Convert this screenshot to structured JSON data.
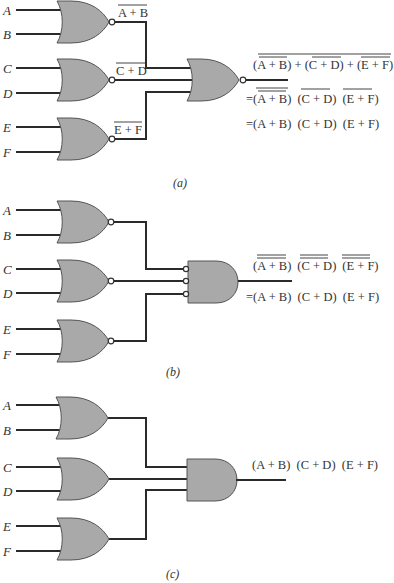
{
  "figure": {
    "panels": [
      {
        "caption": "(a)",
        "inputs": [
          "A",
          "B",
          "C",
          "D",
          "E",
          "F"
        ],
        "first_stage_gate": "NOR",
        "intermediate_labels": [
          "A + B",
          "C + D",
          "E + F"
        ],
        "second_stage_gate": "NOR",
        "output_expressions": [
          "(A + B) + (C + D) + (E + F)",
          "=(A + B) (C + D) (E + F)",
          "=(A + B) (C + D) (E + F)"
        ]
      },
      {
        "caption": "(b)",
        "inputs": [
          "A",
          "B",
          "C",
          "D",
          "E",
          "F"
        ],
        "first_stage_gate": "NOR",
        "second_stage_gate": "AND with inverted inputs",
        "output_expressions": [
          "(A + B) (C + D) (E + F)",
          "=(A + B) (C + D) (E + F)"
        ]
      },
      {
        "caption": "(c)",
        "inputs": [
          "A",
          "B",
          "C",
          "D",
          "E",
          "F"
        ],
        "first_stage_gate": "OR",
        "second_stage_gate": "AND",
        "output_expressions": [
          "(A + B) (C + D) (E + F)"
        ]
      }
    ]
  },
  "a": {
    "inputs": {
      "A": "A",
      "B": "B",
      "C": "C",
      "D": "D",
      "E": "E",
      "F": "F"
    },
    "mid1": "A + B",
    "mid2": "C + D",
    "mid3": "E + F",
    "out1_p1": "(A + B)",
    "out1_plus1": " + ",
    "out1_p2": "(C + D)",
    "out1_plus2": " + ",
    "out1_p3": "(E + F)",
    "out2_eq": "=",
    "out2_p1": "(A + B)",
    "out2_p2": "(C + D)",
    "out2_p3": "(E + F)",
    "out3": "=(A + B)  (C + D)  (E + F)",
    "caption": "(a)"
  },
  "b": {
    "inputs": {
      "A": "A",
      "B": "B",
      "C": "C",
      "D": "D",
      "E": "E",
      "F": "F"
    },
    "out1_p1": "(A + B)",
    "out1_p2": "(C + D)",
    "out1_p3": "(E + F)",
    "out2": "=(A + B)  (C + D)  (E + F)",
    "caption": "(b)"
  },
  "c": {
    "inputs": {
      "A": "A",
      "B": "B",
      "C": "C",
      "D": "D",
      "E": "E",
      "F": "F"
    },
    "out": "(A + B)  (C + D)  (E + F)",
    "caption": "(c)"
  }
}
